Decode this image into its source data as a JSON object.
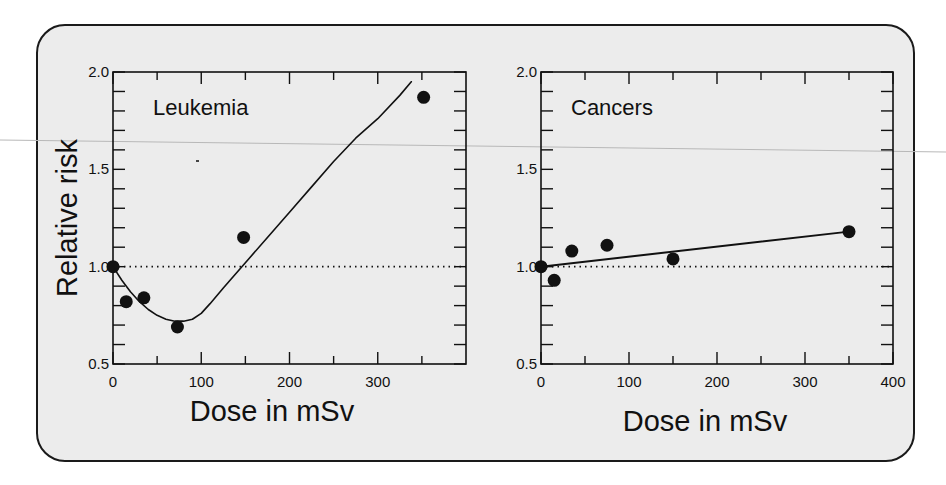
{
  "chart_data": [
    {
      "type": "scatter",
      "title": "Leukemia",
      "xlabel": "Dose in mSv",
      "ylabel": "Relative risk",
      "xlim": [
        0,
        400
      ],
      "ylim": [
        0.5,
        2.0
      ],
      "x_ticks": [
        0,
        100,
        200,
        300
      ],
      "x_minor_ticks": [
        50,
        150,
        250,
        350
      ],
      "y_ticks": [
        0.5,
        1.0,
        1.5,
        2.0
      ],
      "y_minor_ticks": [
        0.6,
        0.7,
        0.8,
        0.9,
        1.1,
        1.2,
        1.3,
        1.4,
        1.6,
        1.7,
        1.8,
        1.9
      ],
      "reference_line": {
        "y": 1.0,
        "style": "dotted"
      },
      "grid": false,
      "series": [
        {
          "name": "observed",
          "kind": "points",
          "x": [
            0,
            15,
            35,
            73,
            148,
            352
          ],
          "y": [
            1.0,
            0.82,
            0.84,
            0.69,
            1.15,
            1.87
          ]
        },
        {
          "name": "fit",
          "kind": "curve",
          "x": [
            0,
            10,
            20,
            30,
            40,
            50,
            60,
            70,
            80,
            90,
            100,
            110,
            125,
            150,
            175,
            200,
            225,
            250,
            275,
            300,
            325,
            338
          ],
          "y": [
            1.0,
            0.93,
            0.87,
            0.82,
            0.78,
            0.75,
            0.73,
            0.72,
            0.72,
            0.73,
            0.76,
            0.81,
            0.89,
            1.02,
            1.15,
            1.28,
            1.41,
            1.54,
            1.66,
            1.76,
            1.88,
            1.95
          ]
        }
      ]
    },
    {
      "type": "scatter",
      "title": "Cancers",
      "xlabel": "Dose in mSv",
      "ylabel": "",
      "xlim": [
        0,
        400
      ],
      "ylim": [
        0.5,
        2.0
      ],
      "x_ticks": [
        0,
        100,
        200,
        300,
        400
      ],
      "x_minor_ticks": [
        50,
        150,
        250,
        350
      ],
      "y_ticks": [
        0.5,
        1.0,
        1.5,
        2.0
      ],
      "y_minor_ticks": [
        0.6,
        0.7,
        0.8,
        0.9,
        1.1,
        1.2,
        1.3,
        1.4,
        1.6,
        1.7,
        1.8,
        1.9
      ],
      "reference_line": {
        "y": 1.0,
        "style": "dotted"
      },
      "grid": false,
      "series": [
        {
          "name": "observed",
          "kind": "points",
          "x": [
            0,
            15,
            35,
            75,
            150,
            350
          ],
          "y": [
            1.0,
            0.93,
            1.08,
            1.11,
            1.04,
            1.18
          ]
        },
        {
          "name": "fit",
          "kind": "line",
          "x": [
            0,
            350
          ],
          "y": [
            1.0,
            1.18
          ]
        }
      ]
    }
  ],
  "figure": {
    "frame_fill": "#ececec",
    "frame_stroke": "#1a1a1a",
    "ink": "#111111"
  }
}
